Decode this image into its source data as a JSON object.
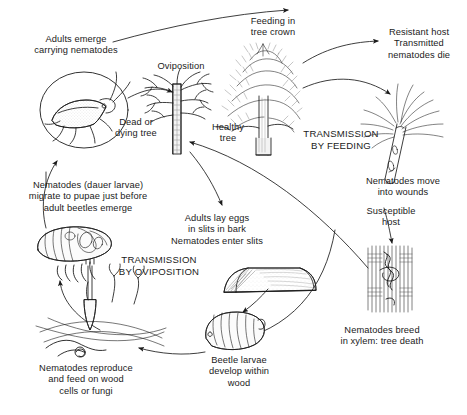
{
  "figure": {
    "background_color": "#ffffff",
    "ink_color": "#1b1b1b",
    "width": 467,
    "height": 415
  },
  "labels": {
    "adults_emerge": "Adults emerge\ncarrying nematodes",
    "oviposition": "Oviposition",
    "feeding_in_tree_crown": "Feeding in\ntree crown",
    "resistant_host": "Resistant host\nTransmitted\nnematodes die",
    "dead_or_dying_tree": "Dead or\ndying tree",
    "healthy_tree": "Healthy\ntree",
    "nematodes_move_into_wounds": "Nematodes move\ninto wounds",
    "susceptible_host": "Susceptible\nhost",
    "nematodes_breed_in_xylem": "Nematodes breed\nin xylem: tree death",
    "adults_lay_eggs": "Adults lay eggs\nin slits in bark\nNematodes enter slits",
    "beetle_larvae_develop": "Beetle larvae\ndevelop within\nwood",
    "nematodes_reproduce": "Nematodes reproduce\nand feed on wood\ncells or fungi",
    "nematodes_dauer_larvae": "Nematodes (dauer larvae)\nmigrate to pupae just before\nadult beetles emerge"
  },
  "section_headings": {
    "transmission_by_feeding": "TRANSMISSION\nBY FEEDING",
    "transmission_by_oviposition": "TRANSMISSION\nBY OVIPOSITION"
  },
  "illustrations": [
    {
      "name": "beetle-in-circle-illustration",
      "描述": "adult longhorn beetle inside a circle"
    },
    {
      "name": "dead-tree-illustration",
      "描述": "bare dead or dying tree with trunk"
    },
    {
      "name": "healthy-pine-tree-illustration",
      "描述": "healthy pine tree with needled crown"
    },
    {
      "name": "pine-shoot-illustration",
      "描述": "pine shoot with needles and feeding wound"
    },
    {
      "name": "xylem-cross-section-illustration",
      "描述": "xylem tissue with nematodes"
    },
    {
      "name": "bark-slit-illustration",
      "描述": "section of bark with oviposition slits"
    },
    {
      "name": "beetle-larva-illustration",
      "描述": "segmented beetle larva"
    },
    {
      "name": "fungal-hyphae-illustration",
      "描述": "fungus and nematodes in wood"
    },
    {
      "name": "beetle-pupa-illustration",
      "描述": "beetle pupa with dauer nematodes"
    }
  ]
}
